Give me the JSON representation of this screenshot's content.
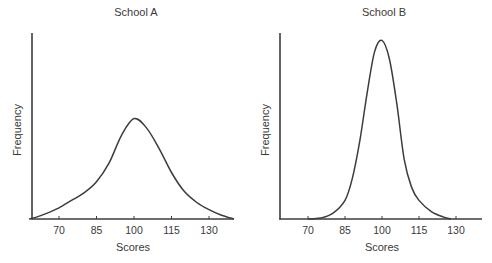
{
  "chart_data": [
    {
      "type": "line",
      "title": "School A",
      "xlabel": "Scores",
      "ylabel": "Frequency",
      "x_ticks": [
        70,
        85,
        100,
        115,
        130
      ],
      "xlim": [
        58,
        140
      ],
      "ylim": [
        0,
        100
      ],
      "grid": false,
      "legend": null,
      "y_ticks_shown": false,
      "series": [
        {
          "name": "School A",
          "x": [
            58,
            61,
            65,
            70,
            75,
            80,
            85,
            90,
            95,
            100,
            105,
            110,
            115,
            120,
            125,
            130,
            135,
            140
          ],
          "values": [
            0,
            1,
            3,
            6,
            10,
            14,
            20,
            30,
            45,
            54,
            49,
            38,
            25,
            15,
            9,
            5,
            2,
            0
          ]
        }
      ]
    },
    {
      "type": "line",
      "title": "School B",
      "xlabel": "Scores",
      "ylabel": "Frequency",
      "x_ticks": [
        70,
        85,
        100,
        115,
        130
      ],
      "xlim": [
        59,
        140
      ],
      "ylim": [
        0,
        100
      ],
      "grid": false,
      "legend": null,
      "y_ticks_shown": false,
      "series": [
        {
          "name": "School B",
          "x": [
            70,
            75,
            80,
            85,
            88,
            91,
            94,
            97,
            100,
            103,
            106,
            109,
            112,
            115,
            120,
            125,
            128
          ],
          "values": [
            0,
            0.5,
            3,
            10,
            22,
            42,
            68,
            90,
            96,
            86,
            62,
            32,
            17,
            10,
            4,
            1,
            0
          ]
        }
      ]
    }
  ],
  "panels": [
    {
      "title": "School A",
      "xlabel": "Scores",
      "ylabel": "Frequency",
      "tick_labels": [
        "70",
        "85",
        "100",
        "115",
        "130"
      ]
    },
    {
      "title": "School B",
      "xlabel": "Scores",
      "ylabel": "Frequency",
      "tick_labels": [
        "70",
        "85",
        "100",
        "115",
        "130"
      ]
    }
  ]
}
